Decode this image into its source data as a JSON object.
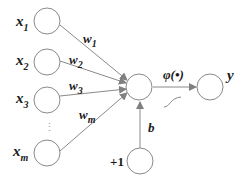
{
  "diagram": {
    "inputs": [
      {
        "var": "x",
        "sub": "1",
        "weight": "w",
        "wsub": "1"
      },
      {
        "var": "x",
        "sub": "2",
        "weight": "w",
        "wsub": "2"
      },
      {
        "var": "x",
        "sub": "3",
        "weight": "w",
        "wsub": "3"
      },
      {
        "var": "x",
        "sub": "m",
        "weight": "w",
        "wsub": "m"
      }
    ],
    "ellipsis": "⋮",
    "bias": {
      "input_label": "+1",
      "weight_label": "b"
    },
    "activation": {
      "label": "φ(•)"
    },
    "output": {
      "label": "y"
    },
    "colors": {
      "node_stroke": "#8a8a8a",
      "edge": "#8a8a8a",
      "arrow": "#808080",
      "text": "#1a1a1a"
    }
  }
}
